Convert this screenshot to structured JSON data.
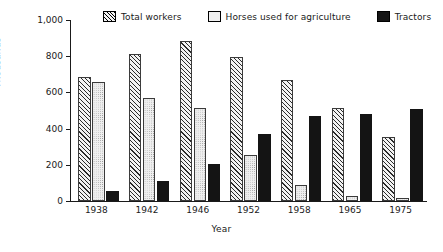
{
  "chart_data": {
    "type": "bar",
    "title": "",
    "subtitle": "",
    "xlabel": "Year",
    "ylabel": "Thousands",
    "categories": [
      "1938",
      "1942",
      "1946",
      "1952",
      "1958",
      "1965",
      "1975"
    ],
    "series": [
      {
        "name": "Total workers",
        "values": [
          683,
          810,
          883,
          797,
          667,
          512,
          353
        ],
        "pattern": "diagonal-hatch"
      },
      {
        "name": "Horses used for agriculture",
        "values": [
          660,
          570,
          512,
          253,
          90,
          25,
          18
        ],
        "pattern": "dotted"
      },
      {
        "name": "Tractors",
        "values": [
          55,
          110,
          203,
          372,
          470,
          480,
          508
        ],
        "pattern": "solid-black"
      }
    ],
    "ylim": [
      0,
      1000
    ],
    "yticks": [
      0,
      200,
      400,
      600,
      800,
      1000
    ],
    "ytick_labels": [
      "0",
      "200",
      "400",
      "600",
      "800",
      "1,000"
    ],
    "grid": false,
    "legend_position": "top"
  },
  "legend": {
    "entries": [
      {
        "label": "Total workers",
        "swatch": "hatch-swatch"
      },
      {
        "label": "Horses used for agriculture",
        "swatch": "dotted-swatch"
      },
      {
        "label": "Tractors",
        "swatch": "solid-swatch"
      }
    ]
  },
  "colors": {
    "axis": "#1a1a1a",
    "tractors": "#141414",
    "workers_fill": "#f3f3f3",
    "horses_fill": "#efefef"
  }
}
